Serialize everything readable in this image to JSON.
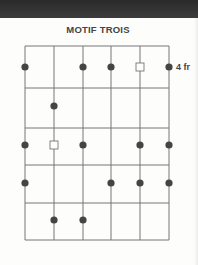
{
  "title": "MOTIF TROIS",
  "fret_label": "4 fr",
  "grid": {
    "strings": 6,
    "frets": 5,
    "x": [
      25,
      54,
      83,
      111,
      140,
      169
    ],
    "y": [
      46,
      88,
      128,
      165,
      203,
      240
    ]
  },
  "colors": {
    "line": "#777777",
    "dot": "#444444",
    "bar": "#333333"
  },
  "markers": [
    {
      "type": "dot",
      "string": 0,
      "row": 0
    },
    {
      "type": "dot",
      "string": 2,
      "row": 0
    },
    {
      "type": "dot",
      "string": 3,
      "row": 0
    },
    {
      "type": "square",
      "string": 4,
      "row": 0
    },
    {
      "type": "dot",
      "string": 5,
      "row": 0
    },
    {
      "type": "dot",
      "string": 1,
      "row": 1
    },
    {
      "type": "dot",
      "string": 0,
      "row": 2
    },
    {
      "type": "square",
      "string": 1,
      "row": 2
    },
    {
      "type": "dot",
      "string": 2,
      "row": 2
    },
    {
      "type": "dot",
      "string": 4,
      "row": 2
    },
    {
      "type": "dot",
      "string": 5,
      "row": 2
    },
    {
      "type": "dot",
      "string": 0,
      "row": 3
    },
    {
      "type": "dot",
      "string": 3,
      "row": 3
    },
    {
      "type": "dot",
      "string": 4,
      "row": 3
    },
    {
      "type": "dot",
      "string": 5,
      "row": 3
    },
    {
      "type": "dot",
      "string": 1,
      "row": 4
    },
    {
      "type": "dot",
      "string": 2,
      "row": 4
    }
  ],
  "marker_y": [
    67,
    106,
    145,
    183,
    220
  ]
}
